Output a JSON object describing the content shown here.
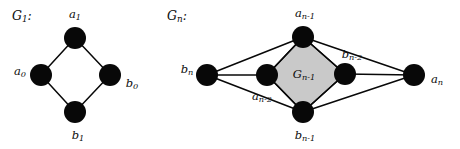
{
  "figure": {
    "background_color": "#ffffff",
    "ink_color": "#080808",
    "region_fill_color": "#c9c9c9",
    "node_radius": 11
  },
  "graphs": [
    {
      "id": "G1",
      "title": "G",
      "title_sub": "1",
      "title_suffix": ":",
      "title_x": 12,
      "title_y": 16,
      "nodes": [
        {
          "name": "a1",
          "base": "a",
          "sub": "1",
          "cx": 75,
          "cy": 38,
          "label_x": 75,
          "label_y": 15,
          "anchor": "middle"
        },
        {
          "name": "a0",
          "base": "a",
          "sub": "0",
          "cx": 41,
          "cy": 75,
          "label_x": 20,
          "label_y": 72,
          "anchor": "middle"
        },
        {
          "name": "b0",
          "base": "b",
          "sub": "0",
          "cx": 110,
          "cy": 75,
          "label_x": 132,
          "label_y": 84,
          "anchor": "middle"
        },
        {
          "name": "b1",
          "base": "b",
          "sub": "1",
          "cx": 75,
          "cy": 112,
          "label_x": 78,
          "label_y": 136,
          "anchor": "middle"
        }
      ],
      "edges": [
        {
          "from": "a1",
          "to": "a0"
        },
        {
          "from": "a1",
          "to": "b0"
        },
        {
          "from": "a0",
          "to": "b1"
        },
        {
          "from": "b0",
          "to": "b1"
        }
      ]
    },
    {
      "id": "Gn",
      "title": "G",
      "title_sub": "n",
      "title_suffix": ":",
      "title_x": 167,
      "title_y": 16,
      "region": {
        "label": "G",
        "label_sub": "n-1",
        "label_x": 304,
        "label_y": 75,
        "polygon": "303,37 345,74 303,112 267,75"
      },
      "nodes": [
        {
          "name": "a_n_1",
          "base": "a",
          "sub": "n-1",
          "cx": 303,
          "cy": 37,
          "label_x": 305,
          "label_y": 14,
          "anchor": "middle"
        },
        {
          "name": "b_n",
          "base": "b",
          "sub": "n",
          "cx": 207,
          "cy": 75,
          "label_x": 187,
          "label_y": 70,
          "anchor": "middle"
        },
        {
          "name": "a_n_2",
          "base": "a",
          "sub": "n-2",
          "cx": 267,
          "cy": 75,
          "label_x": 262,
          "label_y": 97,
          "anchor": "middle"
        },
        {
          "name": "b_n_2",
          "base": "b",
          "sub": "n-2",
          "cx": 345,
          "cy": 74,
          "label_x": 352,
          "label_y": 55,
          "anchor": "middle"
        },
        {
          "name": "a_n",
          "base": "a",
          "sub": "n",
          "cx": 414,
          "cy": 75,
          "label_x": 437,
          "label_y": 80,
          "anchor": "middle"
        },
        {
          "name": "b_n_1",
          "base": "b",
          "sub": "n-1",
          "cx": 303,
          "cy": 112,
          "label_x": 305,
          "label_y": 136,
          "anchor": "middle"
        }
      ],
      "edges": [
        {
          "from": "b_n",
          "to": "a_n_1"
        },
        {
          "from": "b_n",
          "to": "a_n_2"
        },
        {
          "from": "b_n",
          "to": "b_n_1"
        },
        {
          "from": "a_n",
          "to": "a_n_1"
        },
        {
          "from": "a_n",
          "to": "b_n_2"
        },
        {
          "from": "a_n",
          "to": "b_n_1"
        },
        {
          "from": "a_n_1",
          "to": "a_n_2"
        },
        {
          "from": "a_n_1",
          "to": "b_n_2"
        },
        {
          "from": "b_n_1",
          "to": "a_n_2"
        },
        {
          "from": "b_n_1",
          "to": "b_n_2"
        }
      ]
    }
  ]
}
